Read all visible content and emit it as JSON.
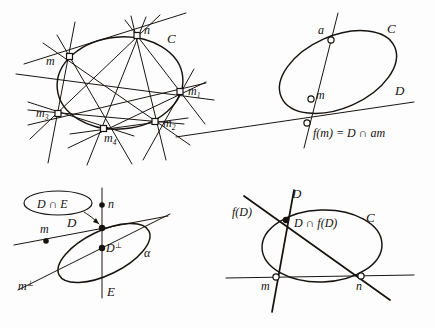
{
  "page": {
    "background_color": "#fdfdfd",
    "ink_color": "#16120f"
  },
  "figures": [
    {
      "id": "figure-1",
      "position": "top-left",
      "conic_label": "C",
      "labels": {
        "m": "m",
        "n": "n",
        "m1_base": "m",
        "m1_sub": "1",
        "m2_base": "m",
        "m2_sub": "2",
        "m3_base": "m",
        "m3_sub": "3",
        "m4_base": "m",
        "m4_sub": "4",
        "conic": "C"
      },
      "points": [
        "m",
        "n",
        "m1",
        "m2",
        "m4",
        "m3"
      ],
      "marker_style": "open-square"
    },
    {
      "id": "figure-2",
      "position": "top-right",
      "labels": {
        "a": "a",
        "m": "m",
        "conic": "C",
        "line_d": "D",
        "equation": "f(m) = D ∩ am"
      },
      "points": [
        "a",
        "m",
        "f(m)"
      ],
      "marker_style": "open-circle"
    },
    {
      "id": "figure-3",
      "position": "bottom-left",
      "labels": {
        "callout": "D ∩ E",
        "n": "n",
        "m": "m",
        "line_d": "D",
        "d_perp_base": "D",
        "d_perp_mark": "⊥",
        "alpha": "α",
        "m_perp_base": "m",
        "m_perp_mark": "⊥",
        "line_e": "E"
      },
      "points": [
        "n",
        "D∩E",
        "D⊥",
        "m"
      ],
      "marker_style": "filled-dot",
      "has_callout_arrow": true
    },
    {
      "id": "figure-4",
      "position": "bottom-right",
      "labels": {
        "f_of_d": "f(D)",
        "line_d": "D",
        "intersection": "D ∩ f(D)",
        "conic": "C",
        "m": "m",
        "n": "n"
      },
      "points": [
        "D∩f(D)",
        "m",
        "n"
      ],
      "marker_style": "open-circle"
    }
  ]
}
